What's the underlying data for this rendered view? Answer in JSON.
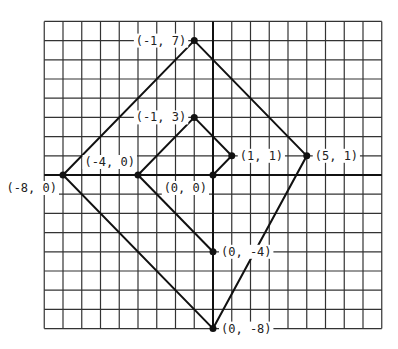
{
  "diagram": {
    "type": "coordinate-grid",
    "grid": {
      "x_range": [
        -9,
        9
      ],
      "y_range": [
        -8,
        8
      ],
      "grid_on": true
    },
    "points": [
      {
        "id": "p1",
        "x": -1,
        "y": 7,
        "label": "(-1, 7)",
        "label_side": "left"
      },
      {
        "id": "p2",
        "x": -1,
        "y": 3,
        "label": "(-1, 3)",
        "label_side": "left"
      },
      {
        "id": "p3",
        "x": 1,
        "y": 1,
        "label": "(1, 1)",
        "label_side": "right"
      },
      {
        "id": "p4",
        "x": 5,
        "y": 1,
        "label": "(5, 1)",
        "label_side": "right"
      },
      {
        "id": "p5",
        "x": -4,
        "y": 0,
        "label": "(-4, 0)",
        "label_side": "above"
      },
      {
        "id": "p6",
        "x": -8,
        "y": 0,
        "label": "(-8, 0)",
        "label_side": "below-left"
      },
      {
        "id": "p7",
        "x": 0,
        "y": 0,
        "label": "(0, 0)",
        "label_side": "below-left"
      },
      {
        "id": "p8",
        "x": 0,
        "y": -4,
        "label": "(0, -4)",
        "label_side": "right"
      },
      {
        "id": "p9",
        "x": 0,
        "y": -8,
        "label": "(0, -8)",
        "label_side": "right"
      }
    ],
    "outer_quadrilateral": [
      "(-8, 0)",
      "(-1, 7)",
      "(5, 1)",
      "(0, -8)"
    ],
    "inner_quadrilateral": [
      "(-4, 0)",
      "(-1, 3)",
      "(1, 1)",
      "(0, 0)"
    ],
    "extra_segments": [
      [
        "(0, 0)",
        "(0, -4)"
      ],
      [
        "(-4, 0)",
        "(0, -4)"
      ]
    ]
  }
}
